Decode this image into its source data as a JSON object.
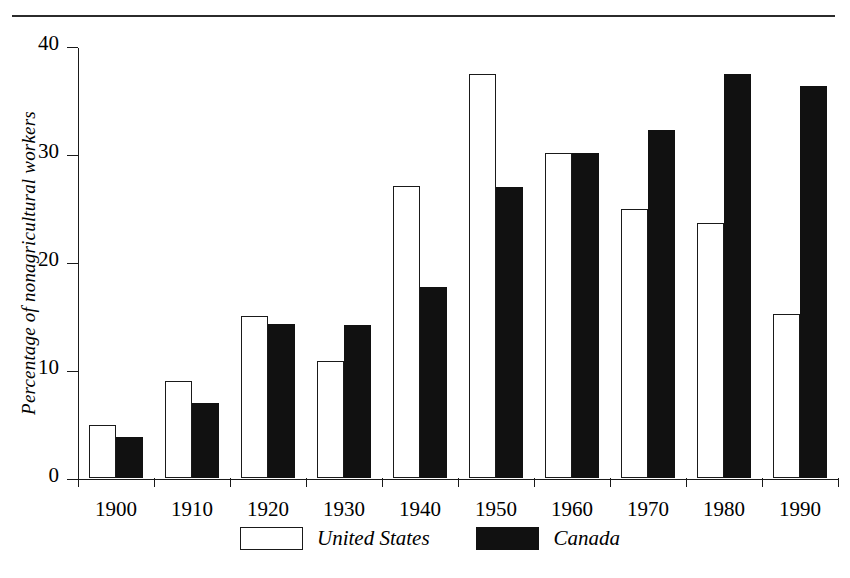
{
  "figure": {
    "top_rule": true,
    "background_color": "#ffffff",
    "ink_color": "#111111"
  },
  "chart_data": {
    "type": "bar",
    "title": "",
    "xlabel": "",
    "ylabel": "Percentage of nonagricultural workers",
    "ylim": [
      0,
      40
    ],
    "yticks": [
      0,
      10,
      20,
      30,
      40
    ],
    "ytick_labels": [
      "0",
      "10",
      "20",
      "30",
      "40"
    ],
    "grid": false,
    "legend_position": "bottom",
    "categories": [
      "1900",
      "1910",
      "1920",
      "1930",
      "1940",
      "1950",
      "1960",
      "1970",
      "1980",
      "1990"
    ],
    "series": [
      {
        "name": "United States",
        "color": "#ffffff",
        "edge_color": "#1a1a1a",
        "values": [
          4.9,
          9.0,
          15.0,
          10.8,
          27.0,
          37.4,
          30.1,
          24.9,
          23.6,
          15.2
        ]
      },
      {
        "name": "Canada",
        "color": "#111111",
        "edge_color": "#111111",
        "values": [
          3.8,
          6.9,
          14.3,
          14.2,
          17.7,
          26.9,
          30.1,
          32.2,
          37.4,
          36.3
        ]
      }
    ]
  },
  "legend": {
    "entries": [
      {
        "label": "United States",
        "swatch": "hollow-rect-swatch"
      },
      {
        "label": "Canada",
        "swatch": "filled-rect-swatch"
      }
    ]
  }
}
